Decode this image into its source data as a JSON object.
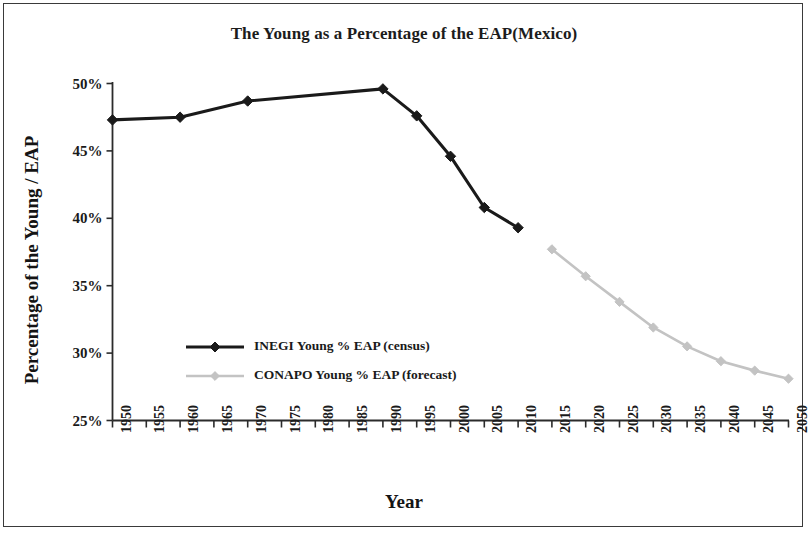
{
  "chart_data": {
    "type": "line",
    "title": "The Young as a Percentage of the EAP(Mexico)",
    "xlabel": "Year",
    "ylabel": "Percentage of the Young  / EAP",
    "xlim": [
      1950,
      2050
    ],
    "ylim": [
      25,
      50
    ],
    "grid": false,
    "legend_position": "inside-center-left",
    "x_tick_labels": [
      "1950",
      "1955",
      "1960",
      "1965",
      "1970",
      "1975",
      "1980",
      "1985",
      "1990",
      "1995",
      "2000",
      "2005",
      "2010",
      "2015",
      "2020",
      "2025",
      "2030",
      "2035",
      "2040",
      "2045",
      "2050"
    ],
    "y_tick_labels": [
      "25%",
      "30%",
      "35%",
      "40%",
      "45%",
      "50%"
    ],
    "y_tick_values": [
      25,
      30,
      35,
      40,
      45,
      50
    ],
    "series": [
      {
        "name": "INEGI Young % EAP (census)",
        "color": "#1a1a1a",
        "marker": "diamond",
        "x": [
          1950,
          1960,
          1970,
          1990,
          1995,
          2000,
          2005,
          2010
        ],
        "values": [
          47.3,
          47.5,
          48.7,
          49.6,
          47.6,
          44.6,
          40.8,
          39.3
        ]
      },
      {
        "name": "CONAPO Young % EAP (forecast)",
        "color": "#c3c3c3",
        "marker": "diamond",
        "x": [
          2015,
          2020,
          2025,
          2030,
          2035,
          2040,
          2045,
          2050
        ],
        "values": [
          37.7,
          35.7,
          33.8,
          31.9,
          30.5,
          29.4,
          28.7,
          28.1
        ]
      }
    ]
  },
  "legend": {
    "entries": [
      {
        "label": "INEGI Young % EAP (census)"
      },
      {
        "label": "CONAPO Young % EAP (forecast)"
      }
    ]
  }
}
